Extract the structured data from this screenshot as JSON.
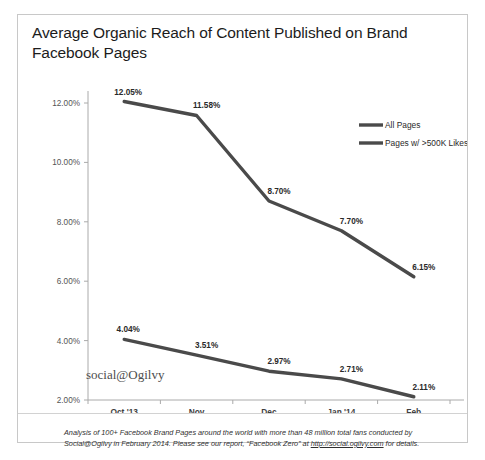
{
  "card": {
    "title": "Average Organic Reach of Content Published on Brand Facebook Pages",
    "watermark": "social@Ogilvy"
  },
  "footnote": {
    "part1": "Analysis of 100+ Facebook Brand Pages around the world with more than 48 million total fans conducted by Social@Ogilvy in February 2014. Please see our report, “Facebook Zero” at ",
    "link": "http://social.ogilvy.com",
    "part2": " for details."
  },
  "chart_data": {
    "type": "line",
    "title": "Average Organic Reach of Content Published on Brand Facebook Pages",
    "xlabel": "",
    "ylabel": "",
    "categories": [
      "Oct '13",
      "Nov",
      "Dec",
      "Jan '14",
      "Feb"
    ],
    "ylim": [
      2.0,
      12.0
    ],
    "yticks": [
      2.0,
      4.0,
      6.0,
      8.0,
      10.0,
      12.0
    ],
    "ytick_labels": [
      "2.00%",
      "4.00%",
      "6.00%",
      "8.00%",
      "10.00%",
      "12.00%"
    ],
    "grid": false,
    "legend_position": "top-right",
    "series": [
      {
        "name": "All Pages",
        "values": [
          12.05,
          11.58,
          8.7,
          7.7,
          6.15
        ],
        "labels": [
          "12.05%",
          "11.58%",
          "8.70%",
          "7.70%",
          "6.15%"
        ],
        "color": "#4a4a4a"
      },
      {
        "name": "Pages w/ >500K Likes",
        "values": [
          4.04,
          3.51,
          2.97,
          2.71,
          2.11
        ],
        "labels": [
          "4.04%",
          "3.51%",
          "2.97%",
          "2.71%",
          "2.11%"
        ],
        "color": "#4a4a4a"
      }
    ]
  }
}
